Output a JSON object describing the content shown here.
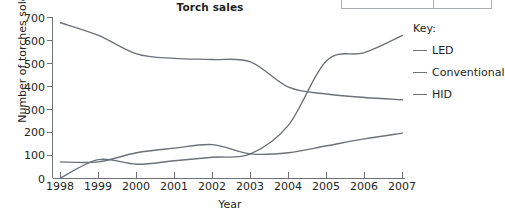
{
  "chart_data": {
    "type": "line",
    "title": "Torch sales",
    "xlabel": "Year",
    "ylabel": "Number of torches sold",
    "x": [
      1998,
      1999,
      2000,
      2001,
      2002,
      2003,
      2004,
      2005,
      2006,
      2007
    ],
    "xtick_labels": [
      "1998",
      "1999",
      "2000",
      "2001",
      "2002",
      "2003",
      "2004",
      "2005",
      "2006",
      "2007"
    ],
    "ytick_labels": [
      "0",
      "100",
      "200",
      "300",
      "400",
      "500",
      "600",
      "700"
    ],
    "yticks": [
      0,
      100,
      200,
      300,
      400,
      500,
      600,
      700
    ],
    "ylim": [
      0,
      700
    ],
    "xlim": [
      1998,
      2007
    ],
    "grid": false,
    "legend_position": "right",
    "legend_title": "Key:",
    "line_color": "#6d7278",
    "axis_color": "#6d7278",
    "series": [
      {
        "name": "LED",
        "values": [
          0,
          80,
          60,
          75,
          90,
          105,
          230,
          510,
          545,
          620
        ]
      },
      {
        "name": "Conventional",
        "values": [
          675,
          620,
          540,
          520,
          515,
          505,
          395,
          365,
          350,
          340
        ]
      },
      {
        "name": "HID",
        "values": [
          70,
          70,
          110,
          130,
          145,
          105,
          110,
          140,
          170,
          195
        ]
      }
    ]
  },
  "axes": {
    "y_zero_label": "0"
  },
  "legend": {
    "title": "Key:",
    "items": [
      {
        "label": "LED"
      },
      {
        "label": "Conventional"
      },
      {
        "label": "HID"
      }
    ]
  }
}
